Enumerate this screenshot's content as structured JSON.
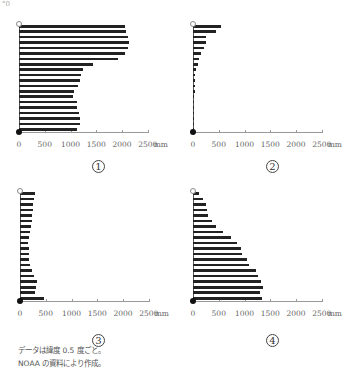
{
  "corner_label": "°0",
  "chart_data": [
    {
      "type": "bar",
      "orientation": "horizontal",
      "title": "①",
      "xlabel": "mm",
      "x_ticks": [
        "0",
        "500",
        "1000",
        "1500",
        "2000",
        "2500"
      ],
      "xlim": [
        0,
        2500
      ],
      "values": [
        2050,
        2080,
        2120,
        2130,
        2110,
        2060,
        1920,
        1440,
        1250,
        1200,
        1180,
        1150,
        1060,
        1050,
        1120,
        1130,
        1170,
        1190,
        1180,
        1130
      ]
    },
    {
      "type": "bar",
      "orientation": "horizontal",
      "title": "②",
      "xlabel": "mm",
      "x_ticks": [
        "0",
        "500",
        "1000",
        "1500",
        "2000",
        "2500"
      ],
      "xlim": [
        0,
        2500
      ],
      "values": [
        540,
        440,
        250,
        250,
        210,
        160,
        110,
        100,
        60,
        40,
        30,
        30,
        30,
        25,
        20,
        20,
        15,
        15,
        10,
        5
      ]
    },
    {
      "type": "bar",
      "orientation": "horizontal",
      "title": "③",
      "xlabel": "mm",
      "x_ticks": [
        "0",
        "500",
        "1000",
        "1500",
        "2000",
        "2500"
      ],
      "xlim": [
        0,
        2500
      ],
      "values": [
        290,
        280,
        250,
        250,
        230,
        230,
        210,
        190,
        170,
        160,
        170,
        170,
        170,
        190,
        230,
        270,
        330,
        310,
        290,
        460
      ]
    },
    {
      "type": "bar",
      "orientation": "horizontal",
      "title": "④",
      "xlabel": "mm",
      "x_ticks": [
        "0",
        "500",
        "1000",
        "1500",
        "2000",
        "2500"
      ],
      "xlim": [
        0,
        2500
      ],
      "values": [
        115,
        190,
        250,
        270,
        290,
        365,
        440,
        575,
        730,
        845,
        925,
        960,
        1040,
        1080,
        1230,
        1270,
        1330,
        1365,
        1310,
        1345
      ]
    }
  ],
  "notes": [
    "データは緯度 0.5 度ごと。",
    "NOAA の資料により作成。"
  ]
}
